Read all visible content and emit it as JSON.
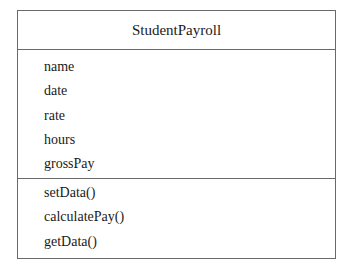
{
  "class_diagram": {
    "class_name": "StudentPayroll",
    "attributes": [
      "name",
      "date",
      "rate",
      "hours",
      "grossPay"
    ],
    "methods": [
      "setData()",
      "calculatePay()",
      "getData()"
    ]
  }
}
